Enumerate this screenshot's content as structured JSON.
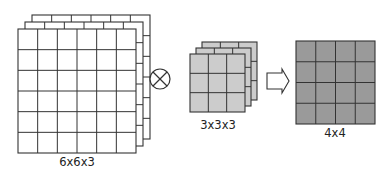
{
  "diagram": {
    "input": {
      "label": "6x6x3",
      "rows": 6,
      "cols": 6,
      "depth": 3,
      "fill": "#ffffff"
    },
    "operator": {
      "name": "convolution",
      "symbol": "circled-times-icon"
    },
    "filter": {
      "label": "3x3x3",
      "rows": 3,
      "cols": 3,
      "depth": 3,
      "fill": "#cccccc"
    },
    "arrow": {
      "name": "result-arrow-icon"
    },
    "output": {
      "label": "4x4",
      "rows": 4,
      "cols": 4,
      "depth": 1,
      "fill": "#9a9a9a"
    },
    "stroke_color": "#333333"
  }
}
